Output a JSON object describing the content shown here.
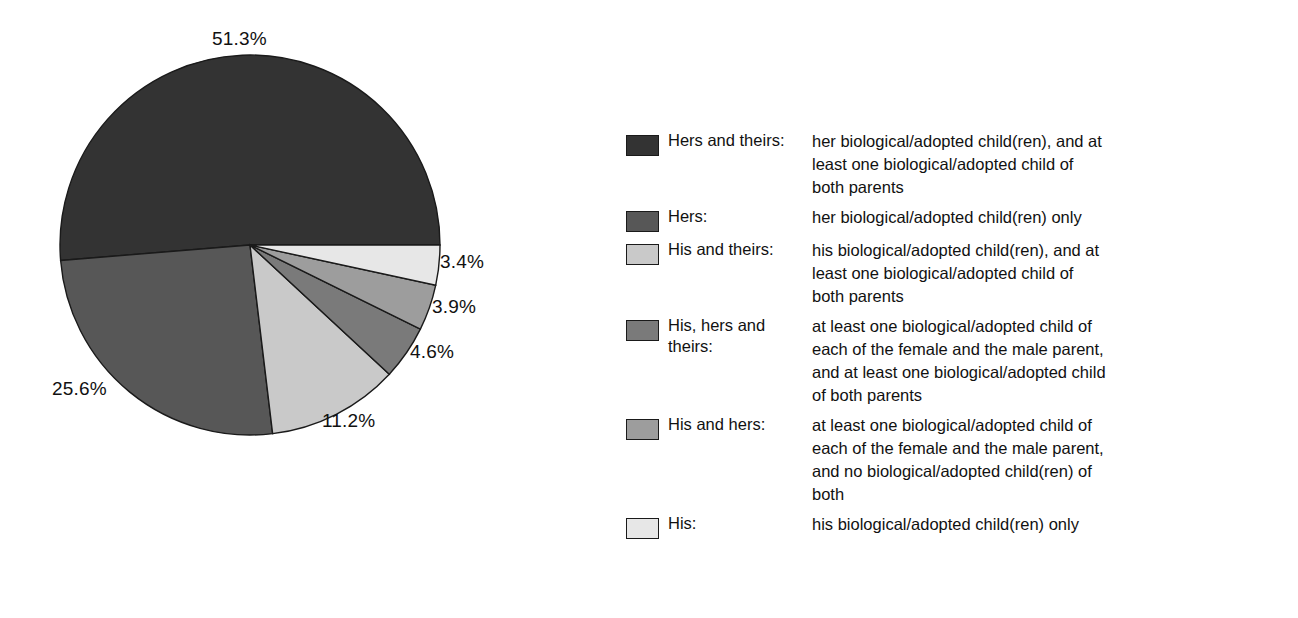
{
  "chart_data": {
    "type": "pie",
    "title": "",
    "subtitle": "",
    "xlabel": "",
    "ylabel": "",
    "units": "percent",
    "legend_position": "right",
    "grid": false,
    "start_angle_deg": 0,
    "direction": "counterclockwise",
    "categories": [
      "Hers and theirs",
      "Hers",
      "His and theirs",
      "His, hers and theirs",
      "His and hers",
      "His"
    ],
    "values": [
      51.3,
      25.6,
      11.2,
      4.6,
      3.9,
      3.4
    ],
    "labels": [
      "51.3%",
      "25.6%",
      "11.2%",
      "4.6%",
      "3.9%",
      "3.4%"
    ],
    "colors": [
      "#333333",
      "#575757",
      "#c9c9c9",
      "#7a7a7a",
      "#9d9d9d",
      "#e7e7e7"
    ],
    "slice_border_color": "#1a1a1a",
    "slices": [
      {
        "name": "Hers and theirs",
        "value": 51.3,
        "label": "51.3%",
        "color": "#333333"
      },
      {
        "name": "Hers",
        "value": 25.6,
        "label": "25.6%",
        "color": "#575757"
      },
      {
        "name": "His and theirs",
        "value": 11.2,
        "label": "11.2%",
        "color": "#c9c9c9"
      },
      {
        "name": "His, hers and theirs",
        "value": 4.6,
        "label": "4.6%",
        "color": "#7a7a7a"
      },
      {
        "name": "His and hers",
        "value": 3.9,
        "label": "3.9%",
        "color": "#9d9d9d"
      },
      {
        "name": "His",
        "value": 3.4,
        "label": "3.4%",
        "color": "#e7e7e7"
      }
    ]
  },
  "pie": {
    "center_x": 250,
    "center_y": 245,
    "radius": 190,
    "labels": [
      {
        "text": "51.3%",
        "x": 212,
        "y": 28
      },
      {
        "text": "3.4%",
        "x": 440,
        "y": 251
      },
      {
        "text": "3.9%",
        "x": 432,
        "y": 296
      },
      {
        "text": "4.6%",
        "x": 410,
        "y": 341
      },
      {
        "text": "11.2%",
        "x": 322,
        "y": 410
      },
      {
        "text": "25.6%",
        "x": 52,
        "y": 378
      }
    ]
  },
  "legend": {
    "items": [
      {
        "swatch_color": "#333333",
        "term": "Hers and theirs:",
        "definition_lines": [
          "her biological/adopted child(ren), and at",
          "least one biological/adopted child of",
          "both parents"
        ]
      },
      {
        "swatch_color": "#575757",
        "term": "Hers:",
        "definition_lines": [
          "her biological/adopted child(ren) only"
        ]
      },
      {
        "swatch_color": "#c9c9c9",
        "term": "His and theirs:",
        "definition_lines": [
          "his biological/adopted child(ren), and at",
          "least one biological/adopted child of",
          "both parents"
        ]
      },
      {
        "swatch_color": "#7a7a7a",
        "term": "His, hers and theirs:",
        "definition_lines": [
          "at least one biological/adopted child of",
          "each of the female and the male parent,",
          "and at least one biological/adopted child",
          "of both parents"
        ]
      },
      {
        "swatch_color": "#9d9d9d",
        "term": "His and hers:",
        "definition_lines": [
          "at least one biological/adopted child of",
          "each of the female and the male parent,",
          "and no biological/adopted child(ren) of",
          "both"
        ]
      },
      {
        "swatch_color": "#e7e7e7",
        "term": "His:",
        "definition_lines": [
          "his biological/adopted child(ren) only"
        ]
      }
    ]
  }
}
